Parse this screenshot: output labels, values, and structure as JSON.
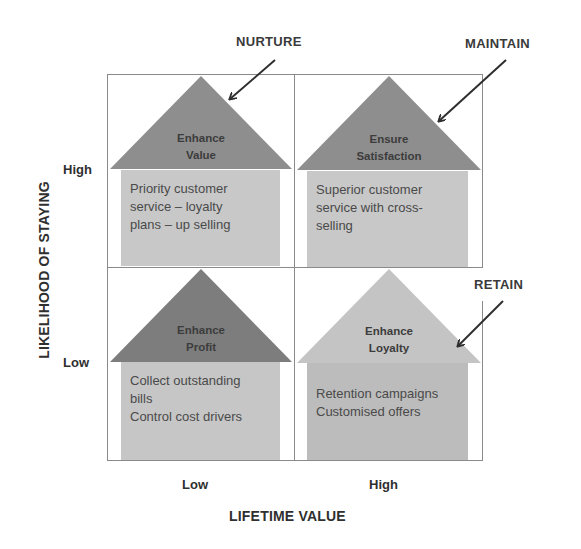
{
  "diagram": {
    "type": "2x2-matrix",
    "x_axis": {
      "title": "LIFETIME VALUE",
      "ticks": [
        "Low",
        "High"
      ]
    },
    "y_axis": {
      "title": "LIKELIHOOD OF STAYING",
      "ticks": [
        "High",
        "Low"
      ]
    },
    "quadrants": [
      {
        "position": "top-left",
        "roof_line1": "Enhance",
        "roof_line2": "Value",
        "body_lines": [
          "Priority customer",
          "service – loyalty",
          "plans – up selling"
        ],
        "callout": "NURTURE",
        "roof_color": "#8e8e8e",
        "body_color": "#c8c8c8"
      },
      {
        "position": "top-right",
        "roof_line1": "Ensure",
        "roof_line2": "Satisfaction",
        "body_lines": [
          "Superior customer",
          "service with cross-",
          "selling"
        ],
        "callout": "MAINTAIN",
        "roof_color": "#8e8e8e",
        "body_color": "#c8c8c8"
      },
      {
        "position": "bottom-left",
        "roof_line1": "Enhance",
        "roof_line2": "Profit",
        "body_lines": [
          "Collect outstanding",
          "bills",
          "Control cost drivers"
        ],
        "callout": null,
        "roof_color": "#7d7d7d",
        "body_color": "#c6c6c6"
      },
      {
        "position": "bottom-right",
        "roof_line1": "Enhance",
        "roof_line2": "Loyalty",
        "body_lines": [
          "Retention campaigns",
          "Customised offers"
        ],
        "callout": "RETAIN",
        "roof_color": "#c4c4c4",
        "body_color": "#bcbcbc"
      }
    ]
  },
  "colors": {
    "grid_line": "#8a8a8a",
    "arrow": "#2e2e2e",
    "background": "#ffffff"
  }
}
